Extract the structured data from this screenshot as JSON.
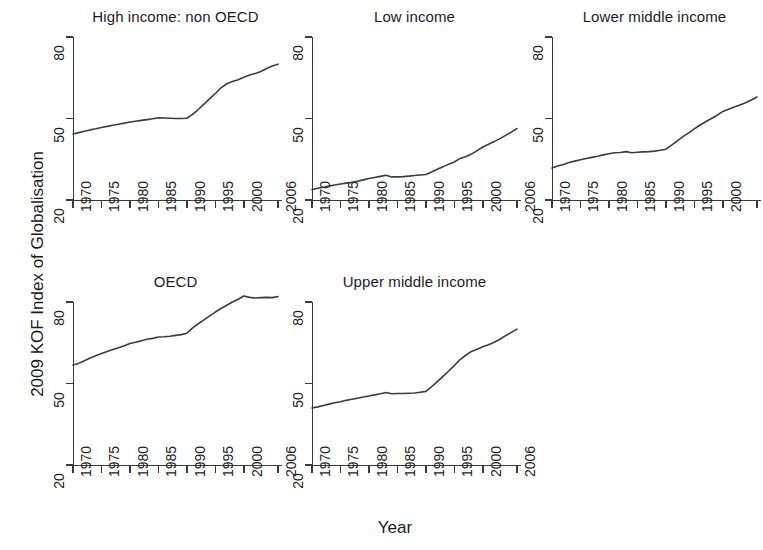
{
  "figure": {
    "ylabel": "2009 KOF Index of Globalisation",
    "xlabel": "Year"
  },
  "axes": {
    "yticks": [
      "20",
      "50",
      "80"
    ],
    "xticks": [
      "1970",
      "1975",
      "1980",
      "1985",
      "1990",
      "1995",
      "2000",
      "2006"
    ]
  },
  "panels": [
    {
      "title": "High income: non OECD"
    },
    {
      "title": "Low income"
    },
    {
      "title": "Lower middle income"
    },
    {
      "title": "OECD"
    },
    {
      "title": "Upper middle income"
    }
  ],
  "chart_data": {
    "type": "line",
    "title": "",
    "xlabel": "Year",
    "ylabel": "2009 KOF Index of Globalisation",
    "xlim": [
      1970,
      2006
    ],
    "ylim": [
      20,
      80
    ],
    "yticks": [
      20,
      50,
      80
    ],
    "xticks": [
      1970,
      1975,
      1980,
      1985,
      1990,
      1995,
      2000,
      2006
    ],
    "grid": false,
    "legend": "none",
    "layout": "small-multiples 2x3 (5 panels used, bottom-right blank)",
    "line_color": "#3c3c3c",
    "x": [
      1970,
      1971,
      1972,
      1973,
      1974,
      1975,
      1976,
      1977,
      1978,
      1979,
      1980,
      1981,
      1982,
      1983,
      1984,
      1985,
      1986,
      1987,
      1988,
      1989,
      1990,
      1991,
      1992,
      1993,
      1994,
      1995,
      1996,
      1997,
      1998,
      1999,
      2000,
      2001,
      2002,
      2003,
      2004,
      2005,
      2006
    ],
    "series": [
      {
        "name": "High income: non OECD",
        "panel": 0,
        "values": [
          44.3,
          44.8,
          45.3,
          45.8,
          46.2,
          46.7,
          47.1,
          47.5,
          47.9,
          48.3,
          48.7,
          49.0,
          49.3,
          49.6,
          49.9,
          50.3,
          50.2,
          50.1,
          50.0,
          50.0,
          50.1,
          51.5,
          53.3,
          55.3,
          57.3,
          59.2,
          61.3,
          62.8,
          63.6,
          64.3,
          65.2,
          66.0,
          66.6,
          67.3,
          68.4,
          69.3,
          70.0
        ]
      },
      {
        "name": "Low income",
        "panel": 1,
        "values": [
          23.8,
          24.3,
          24.7,
          25.1,
          25.5,
          25.9,
          26.2,
          26.5,
          26.9,
          27.4,
          27.9,
          28.3,
          28.7,
          29.1,
          28.5,
          28.5,
          28.6,
          28.8,
          29.0,
          29.2,
          29.4,
          30.3,
          31.3,
          32.2,
          33.2,
          34.0,
          35.3,
          35.9,
          36.9,
          38.2,
          39.5,
          40.5,
          41.5,
          42.6,
          43.8,
          45.0,
          46.3
        ]
      },
      {
        "name": "Lower middle income",
        "panel": 2,
        "values": [
          31.8,
          32.5,
          33.1,
          33.8,
          34.3,
          34.8,
          35.3,
          35.7,
          36.1,
          36.6,
          37.0,
          37.4,
          37.5,
          37.8,
          37.4,
          37.6,
          37.7,
          37.8,
          38.0,
          38.3,
          38.7,
          40.2,
          41.8,
          43.3,
          44.7,
          46.2,
          47.6,
          48.8,
          50.0,
          51.2,
          52.6,
          53.4,
          54.2,
          55.0,
          55.8,
          56.8,
          57.9
        ]
      },
      {
        "name": "OECD",
        "panel": 3,
        "values": [
          56.8,
          57.4,
          58.4,
          59.4,
          60.2,
          61.0,
          61.8,
          62.5,
          63.2,
          63.9,
          64.7,
          65.2,
          65.7,
          66.3,
          66.6,
          67.1,
          67.2,
          67.4,
          67.7,
          68.0,
          68.5,
          70.5,
          72.0,
          73.4,
          74.9,
          76.3,
          77.6,
          78.8,
          80.0,
          81.0,
          82.2,
          81.7,
          81.5,
          81.6,
          81.7,
          81.6,
          82.0
        ]
      },
      {
        "name": "Upper middle income",
        "panel": 4,
        "values": [
          41.0,
          41.4,
          41.9,
          42.4,
          42.9,
          43.3,
          43.8,
          44.2,
          44.6,
          45.0,
          45.4,
          45.8,
          46.2,
          46.7,
          46.2,
          46.3,
          46.3,
          46.4,
          46.5,
          46.8,
          47.1,
          48.8,
          50.7,
          52.6,
          54.6,
          56.6,
          58.8,
          60.4,
          61.8,
          62.6,
          63.5,
          64.3,
          65.2,
          66.3,
          67.6,
          68.8,
          70.0
        ]
      }
    ]
  }
}
